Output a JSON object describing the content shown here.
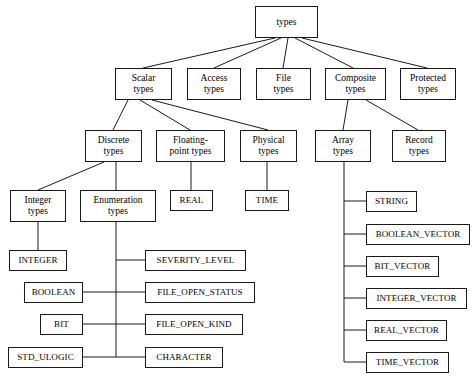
{
  "diagram": {
    "background_color": "#ffffff",
    "line_color": "#1a1a1a",
    "text_color": "#000000"
  },
  "nodes": {
    "types": {
      "label": "types",
      "x": 255,
      "y": 6,
      "w": 63,
      "h": 32
    },
    "scalar_types": {
      "label": "Scalar\ntypes",
      "x": 115,
      "y": 68,
      "w": 57,
      "h": 32
    },
    "access_types": {
      "label": "Access\ntypes",
      "x": 187,
      "y": 68,
      "w": 54,
      "h": 32
    },
    "file_types": {
      "label": "File\ntypes",
      "x": 256,
      "y": 68,
      "w": 55,
      "h": 32
    },
    "composite_types": {
      "label": "Composite\ntypes",
      "x": 325,
      "y": 68,
      "w": 61,
      "h": 32
    },
    "protected_types": {
      "label": "Protected\ntypes",
      "x": 400,
      "y": 68,
      "w": 56,
      "h": 32
    },
    "discrete_types": {
      "label": "Discrete\ntypes",
      "x": 85,
      "y": 130,
      "w": 57,
      "h": 32
    },
    "floating_point_types": {
      "label": "Floating-\npoint types",
      "x": 156,
      "y": 130,
      "w": 69,
      "h": 32
    },
    "physical_types": {
      "label": "Physical\ntypes",
      "x": 240,
      "y": 130,
      "w": 57,
      "h": 32
    },
    "array_types": {
      "label": "Array\ntypes",
      "x": 315,
      "y": 130,
      "w": 56,
      "h": 32
    },
    "record_types": {
      "label": "Record\ntypes",
      "x": 392,
      "y": 130,
      "w": 54,
      "h": 32
    },
    "integer_types": {
      "label": "Integer\ntypes",
      "x": 10,
      "y": 190,
      "w": 56,
      "h": 32
    },
    "enumeration_types": {
      "label": "Enumeration\ntypes",
      "x": 80,
      "y": 190,
      "w": 76,
      "h": 32
    },
    "real": {
      "label": "REAL",
      "x": 170,
      "y": 190,
      "w": 43,
      "h": 21
    },
    "time": {
      "label": "TIME",
      "x": 245,
      "y": 190,
      "w": 44,
      "h": 21
    },
    "integer": {
      "label": "INTEGER",
      "x": 9,
      "y": 250,
      "w": 58,
      "h": 21
    },
    "boolean": {
      "label": "BOOLEAN",
      "x": 24,
      "y": 282,
      "w": 59,
      "h": 21
    },
    "bit": {
      "label": "BIT",
      "x": 40,
      "y": 314,
      "w": 43,
      "h": 21
    },
    "std_ulogic": {
      "label": "STD_ULOGIC",
      "x": 8,
      "y": 347,
      "w": 75,
      "h": 21
    },
    "severity_level": {
      "label": "SEVERITY_LEVEL",
      "x": 145,
      "y": 250,
      "w": 101,
      "h": 21
    },
    "file_open_status": {
      "label": "FILE_OPEN_STATUS",
      "x": 145,
      "y": 282,
      "w": 110,
      "h": 21
    },
    "file_open_kind": {
      "label": "FILE_OPEN_KIND",
      "x": 145,
      "y": 314,
      "w": 98,
      "h": 21
    },
    "character": {
      "label": "CHARACTER",
      "x": 145,
      "y": 347,
      "w": 78,
      "h": 21
    },
    "string": {
      "label": "STRING",
      "x": 366,
      "y": 191,
      "w": 51,
      "h": 21
    },
    "boolean_vector": {
      "label": "BOOLEAN_VECTOR",
      "x": 366,
      "y": 224,
      "w": 104,
      "h": 21
    },
    "bit_vector": {
      "label": "BIT_VECTOR",
      "x": 366,
      "y": 256,
      "w": 73,
      "h": 21
    },
    "integer_vector": {
      "label": "INTEGER_VECTOR",
      "x": 366,
      "y": 288,
      "w": 101,
      "h": 21
    },
    "real_vector": {
      "label": "REAL_VECTOR",
      "x": 366,
      "y": 320,
      "w": 81,
      "h": 21
    },
    "time_vector": {
      "label": "TIME_VECTOR",
      "x": 366,
      "y": 352,
      "w": 83,
      "h": 21
    }
  },
  "edges": [
    {
      "name": "types-to-scalar",
      "points": "275,38 143,68"
    },
    {
      "name": "types-to-access",
      "points": "281,38 214,68"
    },
    {
      "name": "types-to-file",
      "points": "288,38 283,68"
    },
    {
      "name": "types-to-composite",
      "points": "295,38 353,68"
    },
    {
      "name": "types-to-protected",
      "points": "302,38 427,68"
    },
    {
      "name": "scalar-to-discrete",
      "points": "128,100 113,130"
    },
    {
      "name": "scalar-to-floating-point",
      "points": "140,100 190,130"
    },
    {
      "name": "scalar-to-physical",
      "points": "152,100 268,130"
    },
    {
      "name": "composite-to-array",
      "points": "348,100 343,130"
    },
    {
      "name": "composite-to-record",
      "points": "366,100 418,130"
    },
    {
      "name": "discrete-to-integer",
      "points": "104,162 38,190"
    },
    {
      "name": "discrete-to-enumeration",
      "points": "116,162 116,190"
    },
    {
      "name": "floating-point-to-real",
      "points": "191,162 191,190"
    },
    {
      "name": "physical-to-time",
      "points": "267,162 267,190"
    },
    {
      "name": "integer-types-to-integer",
      "points": "38,222 38,250"
    },
    {
      "name": "enumeration-trunk",
      "points": "116,222 116,357"
    },
    {
      "name": "enum-branch-severity",
      "points": "116,260 145,260"
    },
    {
      "name": "enum-branch-file-status",
      "points": "83,292 145,292"
    },
    {
      "name": "enum-branch-file-kind",
      "points": "83,324 145,324"
    },
    {
      "name": "enum-branch-character",
      "points": "83,357 145,357"
    },
    {
      "name": "array-trunk",
      "points": "344,162 344,362"
    },
    {
      "name": "array-branch-string",
      "points": "344,201 366,201"
    },
    {
      "name": "array-branch-boolean-vector",
      "points": "344,234 366,234"
    },
    {
      "name": "array-branch-bit-vector",
      "points": "344,266 366,266"
    },
    {
      "name": "array-branch-integer-vector",
      "points": "344,298 366,298"
    },
    {
      "name": "array-branch-real-vector",
      "points": "344,330 366,330"
    },
    {
      "name": "array-branch-time-vector",
      "points": "344,362 366,362"
    }
  ],
  "hierarchy_data": {
    "root": "types",
    "levels": [
      [
        "types"
      ],
      [
        "Scalar types",
        "Access types",
        "File types",
        "Composite types",
        "Protected types"
      ],
      [
        "Discrete types",
        "Floating-point types",
        "Physical types",
        "Array types",
        "Record types"
      ],
      [
        "Integer types",
        "Enumeration types",
        "REAL",
        "TIME"
      ],
      [
        "INTEGER",
        "BOOLEAN",
        "BIT",
        "STD_ULOGIC",
        "SEVERITY_LEVEL",
        "FILE_OPEN_STATUS",
        "FILE_OPEN_KIND",
        "CHARACTER",
        "STRING",
        "BOOLEAN_VECTOR",
        "BIT_VECTOR",
        "INTEGER_VECTOR",
        "REAL_VECTOR",
        "TIME_VECTOR"
      ]
    ]
  }
}
